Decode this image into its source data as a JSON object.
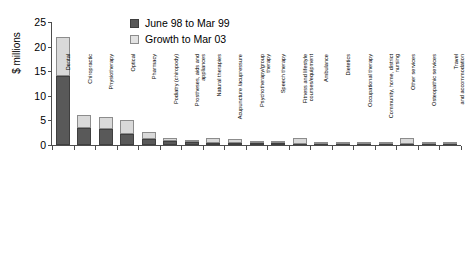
{
  "chart_data": {
    "type": "bar",
    "title": "",
    "subtitle": "",
    "xlabel": "",
    "ylabel": "$ millions",
    "ylim": [
      0,
      25
    ],
    "yticks": [
      0,
      5,
      10,
      15,
      20,
      25
    ],
    "grid": false,
    "stacked": true,
    "legend_position": "top-center",
    "categories": [
      "Dental",
      "Chiropractic",
      "Physiotherapy",
      "Optical",
      "Pharmacy",
      "Podiatry (chiropody)",
      "Prostheses, aids and\nappliances",
      "Natural therapies",
      "Acupuncture /acupressure",
      "Psychotherapy/group\ntherapy",
      "Speech therapy",
      "Fitness and lifestyle\ncourses/equipment",
      "Ambulance",
      "Dietetics",
      "Occupational therapy",
      "Community, home, district\nnursing",
      "Other services",
      "Osteopathic services",
      "Travel\nand accommodation"
    ],
    "series": [
      {
        "name": "June 98 to Mar 99",
        "color": "#595959",
        "values": [
          14.0,
          3.4,
          3.3,
          2.2,
          1.3,
          0.9,
          0.55,
          0.5,
          0.45,
          0.4,
          0.35,
          0.3,
          0.2,
          0.2,
          0.2,
          0.2,
          0.2,
          0.2,
          0.15
        ]
      },
      {
        "name": "Growth to Mar 03",
        "color": "#d9d9d9",
        "values": [
          8.0,
          2.8,
          2.4,
          2.8,
          1.4,
          0.45,
          0.35,
          0.85,
          0.7,
          0.25,
          0.2,
          1.05,
          0.15,
          0.1,
          0.1,
          0.1,
          1.1,
          0.1,
          0.05
        ]
      }
    ],
    "totals": [
      22.0,
      6.2,
      5.7,
      5.0,
      2.7,
      1.35,
      0.9,
      1.35,
      1.15,
      0.65,
      0.55,
      1.35,
      0.35,
      0.3,
      0.3,
      0.3,
      1.3,
      0.3,
      0.2
    ]
  },
  "legend": {
    "items": [
      {
        "label": "June 98 to Mar 99",
        "swatch": "dark"
      },
      {
        "label": "Growth to Mar 03",
        "swatch": "light"
      }
    ]
  }
}
